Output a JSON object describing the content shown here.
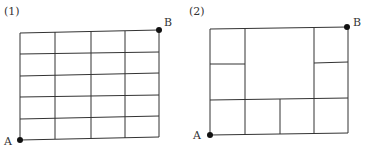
{
  "figures": [
    {
      "number_label": "(1)",
      "start_label": "A",
      "end_label": "B",
      "description": "4 x 5 grid of equal rectangles from A (bottom-left) to B (top-right)"
    },
    {
      "number_label": "(2)",
      "start_label": "A",
      "end_label": "B",
      "description": "4 x 3 grid with a merged 2x2 block in upper middle; left column and right column split into two upper cells"
    }
  ],
  "colors": {
    "line": "#333333",
    "dot": "#111111"
  }
}
